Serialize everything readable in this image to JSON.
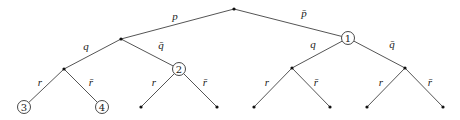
{
  "diagram": {
    "type": "probability-tree",
    "nodes": [
      {
        "id": "root",
        "x": 234,
        "y": 9,
        "kind": "dot"
      },
      {
        "id": "n1",
        "x": 348,
        "y": 38,
        "kind": "circle",
        "label": "1"
      },
      {
        "id": "nq",
        "x": 121,
        "y": 39,
        "kind": "dot"
      },
      {
        "id": "nr",
        "x": 64,
        "y": 69,
        "kind": "dot"
      },
      {
        "id": "n2",
        "x": 179,
        "y": 69,
        "kind": "circle",
        "label": "2"
      },
      {
        "id": "n1q",
        "x": 292,
        "y": 68,
        "kind": "dot"
      },
      {
        "id": "n1qb",
        "x": 405,
        "y": 68,
        "kind": "dot"
      },
      {
        "id": "l3",
        "x": 24,
        "y": 107,
        "kind": "circle",
        "label": "3"
      },
      {
        "id": "l4",
        "x": 102,
        "y": 107,
        "kind": "circle",
        "label": "4"
      },
      {
        "id": "l5",
        "x": 141,
        "y": 107,
        "kind": "dot"
      },
      {
        "id": "l6",
        "x": 217,
        "y": 107,
        "kind": "dot"
      },
      {
        "id": "l7",
        "x": 254,
        "y": 107,
        "kind": "dot"
      },
      {
        "id": "l8",
        "x": 330,
        "y": 107,
        "kind": "dot"
      },
      {
        "id": "l9",
        "x": 367,
        "y": 107,
        "kind": "dot"
      },
      {
        "id": "l10",
        "x": 443,
        "y": 107,
        "kind": "dot"
      }
    ],
    "edges": [
      {
        "from": "root",
        "to": "nq",
        "label": "p",
        "lx": 175,
        "ly": 20
      },
      {
        "from": "root",
        "to": "n1",
        "label": "p̄",
        "lx": 304,
        "ly": 17
      },
      {
        "from": "nq",
        "to": "nr",
        "label": "q",
        "lx": 86,
        "ly": 50
      },
      {
        "from": "nq",
        "to": "n2",
        "label": "q̄",
        "lx": 161,
        "ly": 49
      },
      {
        "from": "nr",
        "to": "l3",
        "label": "r",
        "lx": 40,
        "ly": 86
      },
      {
        "from": "nr",
        "to": "l4",
        "label": "r̄",
        "lx": 91,
        "ly": 86
      },
      {
        "from": "n2",
        "to": "l5",
        "label": "r",
        "lx": 154,
        "ly": 86
      },
      {
        "from": "n2",
        "to": "l6",
        "label": "r̄",
        "lx": 205,
        "ly": 86
      },
      {
        "from": "n1",
        "to": "n1q",
        "label": "q",
        "lx": 313,
        "ly": 48
      },
      {
        "from": "n1",
        "to": "n1qb",
        "label": "q̄",
        "lx": 392,
        "ly": 48
      },
      {
        "from": "n1q",
        "to": "l7",
        "label": "r",
        "lx": 267,
        "ly": 86
      },
      {
        "from": "n1q",
        "to": "l8",
        "label": "r̄",
        "lx": 316,
        "ly": 86
      },
      {
        "from": "n1qb",
        "to": "l9",
        "label": "r",
        "lx": 381,
        "ly": 86
      },
      {
        "from": "n1qb",
        "to": "l10",
        "label": "r̄",
        "lx": 430,
        "ly": 86
      }
    ]
  }
}
